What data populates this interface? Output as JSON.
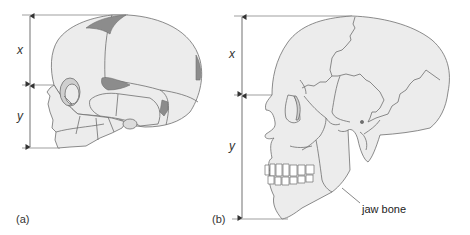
{
  "figure": {
    "panels": [
      {
        "id": "a",
        "label": "(a)",
        "subject": "infant skull",
        "dimensions": [
          {
            "name": "x",
            "label": "x"
          },
          {
            "name": "y",
            "label": "y"
          }
        ]
      },
      {
        "id": "b",
        "label": "(b)",
        "subject": "adult skull",
        "dimensions": [
          {
            "name": "x",
            "label": "x"
          },
          {
            "name": "y",
            "label": "y"
          }
        ],
        "annotations": [
          {
            "label": "jaw bone"
          }
        ]
      }
    ],
    "colors": {
      "bone_fill": "#ececec",
      "outline": "#6e6e6e",
      "fontanelle": "#8c8c8c",
      "guide_line": "#555555"
    }
  }
}
